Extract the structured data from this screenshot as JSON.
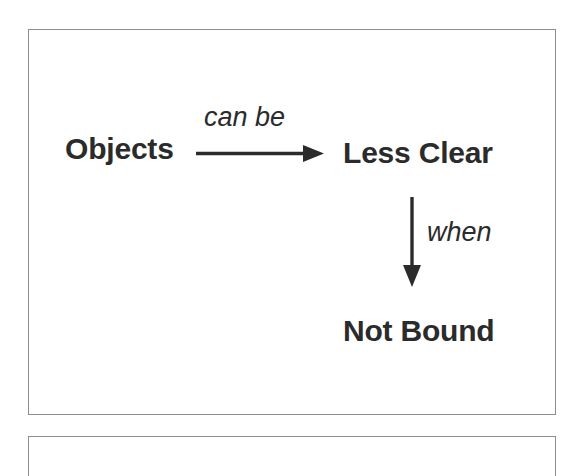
{
  "figure": {
    "type": "flow-diagram",
    "background_color": "#ffffff",
    "border_color": "#8d8d8d",
    "text_color": "#2b2b2b",
    "arrow_color": "#2b2b2b"
  },
  "nodes": [
    {
      "id": "objects",
      "label": "Objects"
    },
    {
      "id": "less_clear",
      "label": "Less Clear"
    },
    {
      "id": "not_bound",
      "label": "Not Bound"
    }
  ],
  "edges": [
    {
      "id": "objects_to_less_clear",
      "label": "can be",
      "from": "objects",
      "to": "less_clear",
      "direction": "right"
    },
    {
      "id": "less_clear_to_not_bound",
      "label": "when",
      "from": "less_clear",
      "to": "not_bound",
      "direction": "down"
    }
  ],
  "panels": {
    "main_panel": "main-figure-frame",
    "next_panel": "next-figure-frame-partial"
  }
}
